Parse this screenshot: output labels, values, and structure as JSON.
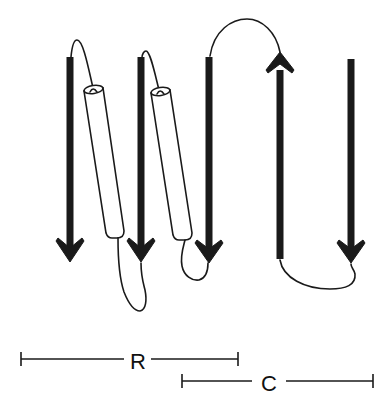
{
  "diagram": {
    "type": "protein topology diagram",
    "colors": {
      "ink": "#1a1a1a",
      "background": "#ffffff"
    },
    "elements": {
      "strands": [
        {
          "id": "strand-1",
          "direction": "down"
        },
        {
          "id": "strand-2",
          "direction": "down"
        },
        {
          "id": "strand-3",
          "direction": "down"
        },
        {
          "id": "strand-4",
          "direction": "up"
        },
        {
          "id": "strand-5",
          "direction": "down"
        }
      ],
      "helices": [
        {
          "id": "helix-1"
        },
        {
          "id": "helix-2"
        }
      ]
    },
    "scale_bars": [
      {
        "id": "range-r",
        "label": "R"
      },
      {
        "id": "range-c",
        "label": "C"
      }
    ]
  }
}
